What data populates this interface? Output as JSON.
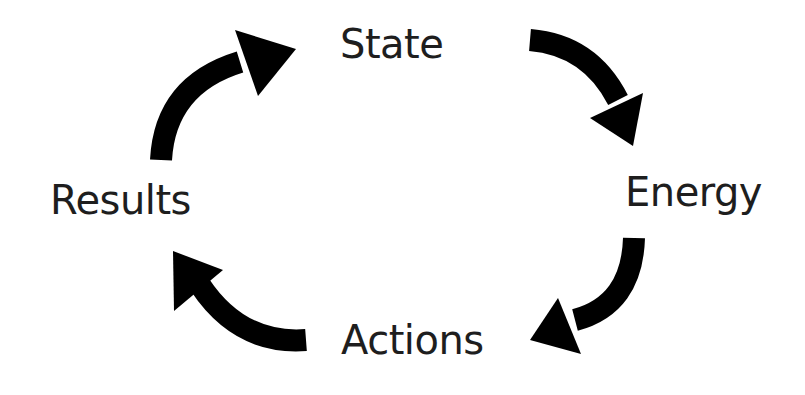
{
  "diagram": {
    "type": "cycle",
    "nodes": [
      {
        "id": "state",
        "label": "State"
      },
      {
        "id": "energy",
        "label": "Energy"
      },
      {
        "id": "actions",
        "label": "Actions"
      },
      {
        "id": "results",
        "label": "Results"
      }
    ],
    "edges": [
      {
        "from": "state",
        "to": "energy"
      },
      {
        "from": "energy",
        "to": "actions"
      },
      {
        "from": "actions",
        "to": "results"
      },
      {
        "from": "results",
        "to": "state"
      }
    ],
    "colors": {
      "arrow": "#000000",
      "text": "#1e1e1e",
      "background": "#ffffff"
    }
  }
}
